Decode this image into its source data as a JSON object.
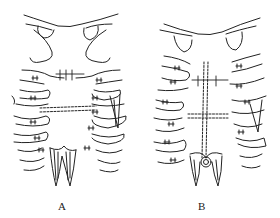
{
  "figure": {
    "panels": [
      {
        "id": "A",
        "label": "A",
        "description": "Chest wall with sternal wire fixation; rib sutures and muscle flaps at lower sternum"
      },
      {
        "id": "B",
        "label": "B",
        "description": "Chest wall with sternal wire fixation; vertical dashed midline and xiphoid region with muscle flaps"
      }
    ],
    "colors": {
      "line": "#222222",
      "background": "#ffffff"
    }
  }
}
